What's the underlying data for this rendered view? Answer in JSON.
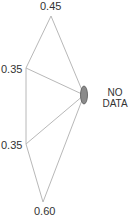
{
  "diagram": {
    "center_node": {
      "label_line1": "NO",
      "label_line2": "DATA",
      "fill": "#8a8a8a"
    },
    "leaves": [
      {
        "label": "0.45"
      },
      {
        "label": "0.35"
      },
      {
        "label": "0.35"
      },
      {
        "label": "0.60"
      }
    ],
    "edge_color": "#b0b0b0"
  }
}
